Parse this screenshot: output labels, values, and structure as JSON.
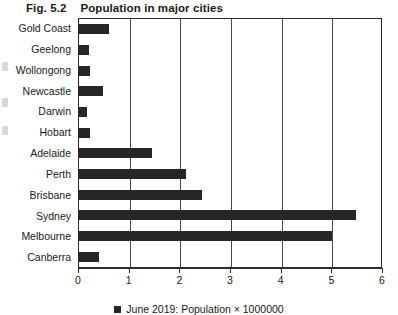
{
  "figure": {
    "number": "Fig. 5.2",
    "caption": "Population in major cities"
  },
  "legend": {
    "marker": "square-marker",
    "label": "June 2019: Population × 1000000"
  },
  "chart_data": {
    "type": "bar",
    "orientation": "horizontal",
    "title": "Population in major cities",
    "xlabel": "",
    "ylabel": "",
    "xlim": [
      0,
      6
    ],
    "xticks": [
      "0",
      "1",
      "2",
      "3",
      "4",
      "5",
      "6"
    ],
    "grid": "vertical",
    "legend_position": "bottom-center",
    "series": [
      {
        "name": "June 2019: Population × 1000000",
        "color": "#262626",
        "values": [
          0.59,
          0.19,
          0.22,
          0.47,
          0.15,
          0.22,
          1.45,
          2.12,
          2.42,
          5.47,
          5.0,
          0.39
        ]
      }
    ],
    "categories": [
      "Gold Coast",
      "Geelong",
      "Wollongong",
      "Newcastle",
      "Darwin",
      "Hobart",
      "Adelaide",
      "Perth",
      "Brisbane",
      "Sydney",
      "Melbourne",
      "Canberra"
    ]
  }
}
